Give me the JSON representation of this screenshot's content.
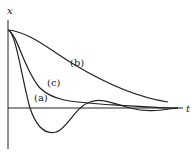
{
  "diagram": {
    "title": "",
    "axes": {
      "vertical_label": "x",
      "horizontal_label": "t"
    },
    "curves": [
      {
        "id": "a",
        "label": "(a)"
      },
      {
        "id": "b",
        "label": "(b)"
      },
      {
        "id": "c",
        "label": "(c)"
      }
    ],
    "colors": {
      "line": "#222222",
      "background": "#ffffff"
    }
  }
}
